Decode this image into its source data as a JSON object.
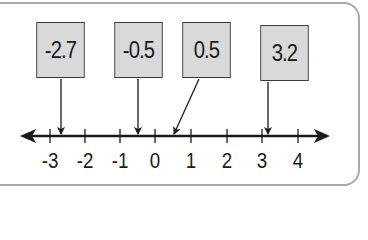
{
  "diagram": {
    "type": "number-line",
    "axis": {
      "min": -3,
      "max": 4,
      "ticks": [
        "-3",
        "-2",
        "-1",
        "0",
        "1",
        "2",
        "3",
        "4"
      ]
    },
    "labels": [
      {
        "id": "minus-2-7",
        "text": "-2.7",
        "value": -2.7
      },
      {
        "id": "minus-0-5",
        "text": "-0.5",
        "value": -0.5
      },
      {
        "id": "plus-0-5",
        "text": "0.5",
        "value": 0.5
      },
      {
        "id": "plus-3-2",
        "text": "3.2",
        "value": 3.2
      }
    ],
    "colors": {
      "box_fill": "#d9d9d9",
      "line": "#1a1a1a",
      "frame": "#a9a9a9"
    }
  }
}
